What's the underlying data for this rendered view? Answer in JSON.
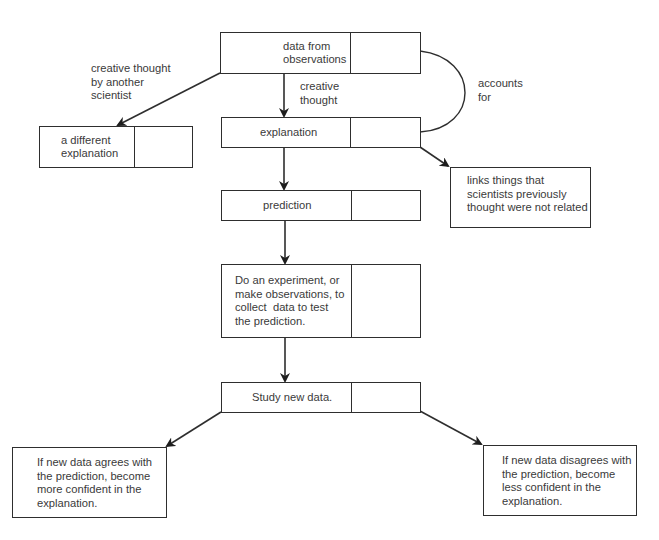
{
  "diagram": {
    "nodes": {
      "data_obs": {
        "label": "data from\nobservations"
      },
      "explanation": {
        "label": "explanation"
      },
      "different_explanation": {
        "label": "a different\nexplanation"
      },
      "links": {
        "label": "links things that\nscientists previously\nthought were not related"
      },
      "prediction": {
        "label": "prediction"
      },
      "experiment": {
        "label": "Do an experiment, or\nmake observations, to\ncollect  data to test\nthe prediction."
      },
      "study": {
        "label": "Study new data."
      },
      "agrees": {
        "label": "If new data agrees with\nthe prediction, become\nmore confident in the\nexplanation."
      },
      "disagrees": {
        "label": "If new data disagrees with\nthe prediction, become\nless confident in the\nexplanation."
      }
    },
    "edge_labels": {
      "creative_thought_other": "creative thought\nby another\nscientist",
      "creative_thought": "creative\nthought",
      "accounts_for": "accounts\nfor"
    },
    "colors": {
      "line": "#2e2e2e",
      "text": "#3a3a3a",
      "background": "#ffffff"
    }
  }
}
